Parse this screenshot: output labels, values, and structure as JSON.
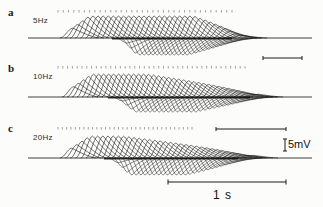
{
  "figure": {
    "type": "electrophysiology-trace-figure",
    "background_color": "#fcfcfa",
    "trace_color": "#111111",
    "panels": [
      {
        "letter": "a",
        "frequency_label": "5Hz",
        "letter_pos": {
          "x": 8,
          "y": 6
        },
        "label_pos": {
          "x": 33,
          "y": 16
        },
        "baseline_y": 38,
        "baseline_x0": 28,
        "baseline_x1": 312,
        "stim_y": 10,
        "stim_x0": 58,
        "stim_x1": 232,
        "stim_count": 34,
        "burst_start_x": 60,
        "burst_end_x": 232,
        "n_traces": 34,
        "peak_amp": 22,
        "trough_amp": 17,
        "trough_start_x": 112,
        "trough_end_x": 232,
        "rise_width": 13,
        "decay_width": 26,
        "plateau_frac": 0.62,
        "offset_step": 5.1
      },
      {
        "letter": "b",
        "frequency_label": "10Hz",
        "letter_pos": {
          "x": 8,
          "y": 62
        },
        "label_pos": {
          "x": 33,
          "y": 72
        },
        "baseline_y": 97,
        "baseline_x0": 28,
        "baseline_x1": 312,
        "stim_y": 66,
        "stim_x0": 58,
        "stim_x1": 245,
        "stim_count": 40,
        "burst_start_x": 62,
        "burst_end_x": 252,
        "n_traces": 38,
        "peak_amp": 23,
        "trough_amp": 15,
        "trough_start_x": 108,
        "trough_end_x": 250,
        "rise_width": 12,
        "decay_width": 24,
        "plateau_frac": 0.3,
        "offset_step": 5.0
      },
      {
        "letter": "c",
        "frequency_label": "20Hz",
        "letter_pos": {
          "x": 8,
          "y": 122
        },
        "label_pos": {
          "x": 33,
          "y": 133
        },
        "baseline_y": 158,
        "baseline_x0": 28,
        "baseline_x1": 312,
        "stim_y": 127,
        "stim_x0": 58,
        "stim_x1": 192,
        "stim_count": 32,
        "burst_start_x": 60,
        "burst_end_x": 248,
        "n_traces": 36,
        "peak_amp": 22,
        "trough_amp": 17,
        "trough_start_x": 104,
        "trough_end_x": 238,
        "rise_width": 12,
        "decay_width": 24,
        "plateau_frac": 0.18,
        "offset_step": 5.2
      }
    ],
    "scalebars": {
      "small_bar": {
        "name": "panel-b-scale-bar",
        "x0": 263,
        "x1": 302,
        "y": 58,
        "tick_height": 4
      },
      "mid_bar": {
        "name": "panel-c-scale-bar",
        "x0": 216,
        "x1": 286,
        "y": 129,
        "tick_height": 4
      },
      "voltage": {
        "label": "5mV",
        "label_x": 288,
        "label_y": 138,
        "bar_x": 285,
        "bar_y0": 139,
        "bar_y1": 151,
        "cap_width": 4
      },
      "time": {
        "label": "1 s",
        "label_x": 213,
        "label_y": 188,
        "bar_x0": 168,
        "bar_x1": 286,
        "bar_y": 182,
        "tick_height": 5
      }
    }
  },
  "chart_data": {
    "type": "line",
    "title": "",
    "xlabel": "",
    "ylabel": "",
    "legend_position": "none",
    "grid": false,
    "scale_voltage_mV": 5,
    "scale_time_s": 1,
    "series": [
      {
        "name": "5Hz",
        "stimulus_frequency_Hz": 5,
        "n_sweeps": 34,
        "peak_depolarization_mV": 5.5,
        "peak_hyperpolarization_mV": -4.2,
        "burst_duration_s": 1.45
      },
      {
        "name": "10Hz",
        "stimulus_frequency_Hz": 10,
        "n_sweeps": 38,
        "peak_depolarization_mV": 5.8,
        "peak_hyperpolarization_mV": -3.8,
        "burst_duration_s": 1.6
      },
      {
        "name": "20Hz",
        "stimulus_frequency_Hz": 20,
        "n_sweeps": 36,
        "peak_depolarization_mV": 5.5,
        "peak_hyperpolarization_mV": -4.2,
        "burst_duration_s": 1.6
      }
    ]
  }
}
